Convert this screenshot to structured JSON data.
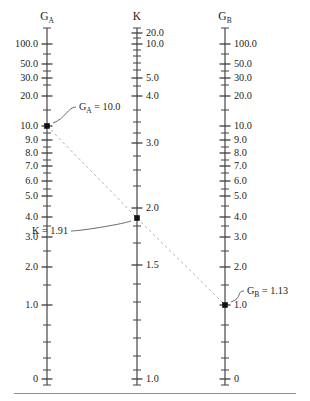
{
  "figure": {
    "type": "nomogram",
    "background_color": "#ffffff",
    "ink_color": "#1a1a1a",
    "isopleth_color": "#b8b8b8",
    "marker_color": "#111111",
    "width": 310,
    "height": 401,
    "footer_rule": true
  },
  "scales": [
    {
      "id": "g_a",
      "name": "scale-ga",
      "title": "G",
      "title_subscript": "A",
      "axis_x": 47,
      "axis_top": 28,
      "axis_bottom": 385,
      "label_side": "left",
      "labels": [
        "100.0",
        "50.0",
        "30.0",
        "20.0",
        "10.0",
        "9.0",
        "8.0",
        "7.0",
        "6.0",
        "5.0",
        "4.0",
        "3.0",
        "2.0",
        "1.0",
        "0"
      ],
      "label_y": [
        44,
        64,
        78,
        96,
        126,
        140,
        153,
        166,
        181,
        196,
        217,
        237,
        267,
        305,
        379
      ],
      "minor_y": [
        28,
        54,
        71,
        85,
        110,
        133,
        147,
        160,
        173,
        189,
        206,
        226,
        251,
        285,
        325,
        342,
        358,
        370,
        385
      ]
    },
    {
      "id": "k",
      "name": "scale-k",
      "title": "K",
      "title_subscript": "",
      "axis_x": 137,
      "axis_top": 28,
      "axis_bottom": 385,
      "label_side": "right",
      "labels": [
        "20.0",
        "10.0",
        "5.0",
        "4.0",
        "3.0",
        "2.0",
        "1.5",
        "1.0"
      ],
      "label_y": [
        33,
        44,
        78,
        96,
        143,
        208,
        265,
        379
      ],
      "minor_y": [
        28,
        38,
        50,
        56,
        63,
        70,
        86,
        110,
        122,
        133,
        156,
        170,
        186,
        226,
        243,
        284,
        302,
        320,
        338,
        356,
        370,
        385
      ]
    },
    {
      "id": "g_b",
      "name": "scale-gb",
      "title": "G",
      "title_subscript": "B",
      "axis_x": 225,
      "axis_top": 28,
      "axis_bottom": 385,
      "label_side": "right",
      "labels": [
        "100.0",
        "50.0",
        "30.0",
        "20.0",
        "10.0",
        "9.0",
        "8.0",
        "7.0",
        "6.0",
        "5.0",
        "4.0",
        "3.0",
        "2.0",
        "1.0",
        "0"
      ],
      "label_y": [
        44,
        64,
        78,
        96,
        126,
        140,
        153,
        166,
        181,
        196,
        217,
        237,
        267,
        305,
        379
      ],
      "minor_y": [
        28,
        54,
        71,
        85,
        110,
        133,
        147,
        160,
        173,
        189,
        206,
        226,
        251,
        285,
        325,
        342,
        358,
        370,
        385
      ]
    }
  ],
  "readings": [
    {
      "id": "reading_ga",
      "name": "reading-ga",
      "variable": "G",
      "subscript": "A",
      "equals": " = ",
      "value": "10.0",
      "text": "G_A = 10.0",
      "point_x": 47,
      "point_y": 126,
      "label_x": 79,
      "label_y": 107
    },
    {
      "id": "reading_k",
      "name": "reading-k",
      "variable": "K",
      "subscript": "",
      "equals": " = ",
      "value": "1.91",
      "text": "K = 1.91",
      "point_x": 137,
      "point_y": 218,
      "label_x": 68,
      "label_y": 231
    },
    {
      "id": "reading_gb",
      "name": "reading-gb",
      "variable": "G",
      "subscript": "B",
      "equals": " = ",
      "value": "1.13",
      "text": "G_B = 1.13",
      "point_x": 225,
      "point_y": 305,
      "label_x": 247,
      "label_y": 291
    }
  ],
  "isopleth": {
    "name": "isopleth-line",
    "from": {
      "x": 47,
      "y": 126
    },
    "via": {
      "x": 137,
      "y": 218
    },
    "to": {
      "x": 225,
      "y": 305
    }
  },
  "chart_data": {
    "type": "nomogram",
    "title": "",
    "axes": [
      {
        "name": "G_A",
        "scale": "log",
        "ticks": [
          100.0,
          50.0,
          30.0,
          20.0,
          10.0,
          9.0,
          8.0,
          7.0,
          6.0,
          5.0,
          4.0,
          3.0,
          2.0,
          1.0,
          0
        ],
        "range": [
          0,
          100.0
        ]
      },
      {
        "name": "K",
        "scale": "log",
        "ticks": [
          20.0,
          10.0,
          5.0,
          4.0,
          3.0,
          2.0,
          1.5,
          1.0
        ],
        "range": [
          1.0,
          20.0
        ]
      },
      {
        "name": "G_B",
        "scale": "log",
        "ticks": [
          100.0,
          50.0,
          30.0,
          20.0,
          10.0,
          9.0,
          8.0,
          7.0,
          6.0,
          5.0,
          4.0,
          3.0,
          2.0,
          1.0,
          0
        ],
        "range": [
          0,
          100.0
        ]
      }
    ],
    "solution": {
      "G_A": 10.0,
      "K": 1.91,
      "G_B": 1.13
    },
    "grid": false,
    "legend": "none"
  }
}
